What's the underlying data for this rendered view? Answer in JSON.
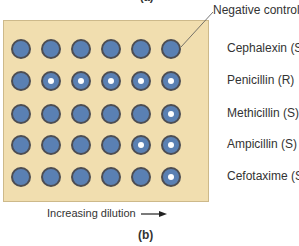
{
  "figure": {
    "top_panel_label": "(a)",
    "panel_label": "(b)",
    "negative_control_label": "Negative control",
    "x_axis_label": "Increasing dilution",
    "arrow_icon": "right-arrow",
    "colors": {
      "plate": "#f1deaf",
      "well_fill": "#5a80b3",
      "well_border": "#4d4d52",
      "growth_dot": "#ffffff"
    },
    "rows": [
      {
        "label": "Cephalexin (S)",
        "wells": [
          0,
          0,
          0,
          0,
          0,
          0
        ]
      },
      {
        "label": "Penicillin (R)",
        "wells": [
          0,
          1,
          1,
          1,
          1,
          1
        ]
      },
      {
        "label": "Methicillin (S)",
        "wells": [
          0,
          0,
          0,
          0,
          0,
          1
        ]
      },
      {
        "label": "Ampicillin (S)",
        "wells": [
          0,
          0,
          0,
          0,
          1,
          1
        ]
      },
      {
        "label": "Cefotaxime (S)",
        "wells": [
          0,
          0,
          0,
          0,
          0,
          1
        ]
      }
    ]
  }
}
